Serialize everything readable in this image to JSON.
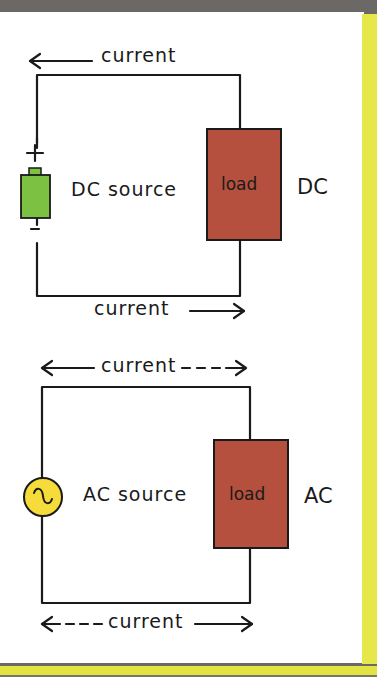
{
  "diagram": {
    "dc_circuit": {
      "top_label": "current",
      "top_arrow": "left",
      "bottom_label": "current",
      "bottom_arrow": "right",
      "source_label": "DC source",
      "source_symbol": "battery-icon",
      "plus_sign": "+",
      "minus_sign": "-",
      "load_label": "load",
      "type_label": "DC"
    },
    "ac_circuit": {
      "top_label": "current",
      "top_arrow": "left-solid right-dashed",
      "bottom_label": "current",
      "bottom_arrow": "left-dashed right-solid",
      "source_label": "AC source",
      "source_symbol": "ac-sine-icon",
      "load_label": "load",
      "type_label": "AC"
    },
    "colors": {
      "battery": "#7dc143",
      "load": "#b5503f",
      "ac_source": "#f5dc3a",
      "accent_border": "#e6e84a",
      "background_frame": "#6b6866",
      "wire": "#1a1a1a"
    }
  }
}
